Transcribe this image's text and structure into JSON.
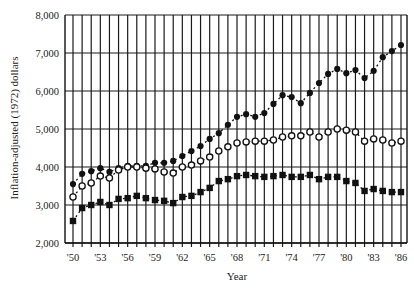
{
  "chart_data": {
    "type": "scatter",
    "title": "",
    "xlabel": "Year",
    "ylabel": "Inflation-adjusted (1972) dollars",
    "ylim": [
      2000,
      8000
    ],
    "xlim": [
      1950,
      1986
    ],
    "grid": true,
    "legend": "none",
    "y_ticks": [
      2000,
      3000,
      4000,
      5000,
      6000,
      7000,
      8000
    ],
    "y_tick_labels": [
      "2,000",
      "3,000",
      "4,000",
      "5,000",
      "6,000",
      "7,000",
      "8,000"
    ],
    "x_tick_labels": [
      "'50",
      "'53",
      "'56",
      "'59",
      "'62",
      "'65",
      "'68",
      "'71",
      "'74",
      "'77",
      "'80",
      "'83",
      "'86"
    ],
    "x_tick_years": [
      1950,
      1953,
      1956,
      1959,
      1962,
      1965,
      1968,
      1971,
      1974,
      1977,
      1980,
      1983,
      1986
    ],
    "x": [
      1950,
      1951,
      1952,
      1953,
      1954,
      1955,
      1956,
      1957,
      1958,
      1959,
      1960,
      1961,
      1962,
      1963,
      1964,
      1965,
      1966,
      1967,
      1968,
      1969,
      1970,
      1971,
      1972,
      1973,
      1974,
      1975,
      1976,
      1977,
      1978,
      1979,
      1980,
      1981,
      1982,
      1983,
      1984,
      1985,
      1986
    ],
    "series": [
      {
        "name": "filled circles",
        "marker": "filled-circle",
        "values": [
          3550,
          3820,
          3890,
          3970,
          3870,
          3970,
          4030,
          4030,
          4030,
          4110,
          4110,
          4160,
          4290,
          4420,
          4550,
          4740,
          4890,
          5110,
          5320,
          5390,
          5320,
          5420,
          5660,
          5890,
          5840,
          5680,
          5950,
          6210,
          6450,
          6580,
          6470,
          6550,
          6340,
          6530,
          6890,
          7050,
          7210
        ]
      },
      {
        "name": "open circles",
        "marker": "open-circle",
        "values": [
          3210,
          3500,
          3580,
          3760,
          3710,
          3920,
          4000,
          4000,
          3970,
          3950,
          3870,
          3840,
          4000,
          4050,
          4160,
          4260,
          4420,
          4530,
          4630,
          4660,
          4680,
          4680,
          4710,
          4790,
          4820,
          4820,
          4920,
          4790,
          4920,
          5000,
          4970,
          4920,
          4680,
          4740,
          4710,
          4630,
          4680
        ]
      },
      {
        "name": "filled squares",
        "marker": "filled-square",
        "values": [
          2580,
          2920,
          3000,
          3080,
          3000,
          3160,
          3180,
          3240,
          3180,
          3130,
          3110,
          3050,
          3210,
          3240,
          3340,
          3450,
          3630,
          3680,
          3760,
          3790,
          3760,
          3740,
          3760,
          3790,
          3740,
          3740,
          3790,
          3680,
          3740,
          3740,
          3630,
          3580,
          3370,
          3420,
          3370,
          3340,
          3340
        ]
      }
    ]
  },
  "colors": {
    "ink": "#111111",
    "grid": "#1a1a1a",
    "background": "#ffffff"
  }
}
